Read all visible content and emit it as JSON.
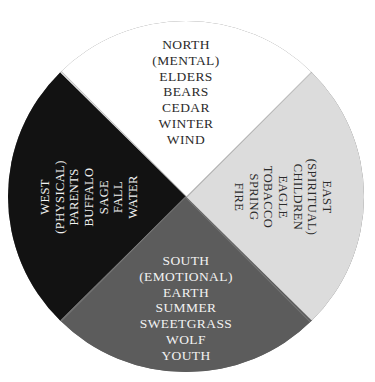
{
  "figure": {
    "name": "medicine-wheel",
    "center_label": "",
    "outline_color": "#6d6d6d"
  },
  "quadrants": {
    "north": {
      "direction": "NORTH",
      "aspect": "(MENTAL)",
      "fill_color": "#ffffff",
      "text_color": "#2b2b2b",
      "lines": [
        "NORTH",
        "(MENTAL)",
        "ELDERS",
        "BEARS",
        "CEDAR",
        "WINTER",
        "WIND"
      ]
    },
    "east": {
      "direction": "EAST",
      "aspect": "(SPIRITUAL)",
      "fill_color": "#dcdcdc",
      "text_color": "#2b2b2b",
      "lines": [
        "EAST",
        "(SPIRITUAL)",
        "CHILDREN",
        "EAGLE",
        "TOBACCO",
        "SPRING",
        "FIRE"
      ]
    },
    "south": {
      "direction": "SOUTH",
      "aspect": "(EMOTIONAL)",
      "fill_color": "#5c5c5c",
      "text_color": "#f2f2f2",
      "lines": [
        "SOUTH",
        "(EMOTIONAL)",
        "EARTH",
        "SUMMER",
        "SWEETGRASS",
        "WOLF",
        "YOUTH"
      ]
    },
    "west": {
      "direction": "WEST",
      "aspect": "(PHYSICAL)",
      "fill_color": "#121212",
      "text_color": "#f2f2f2",
      "lines": [
        "WEST",
        "(PHYSICAL)",
        "PARENTS",
        "BUFFALO",
        "SAGE",
        "FALL",
        "WATER"
      ]
    }
  }
}
